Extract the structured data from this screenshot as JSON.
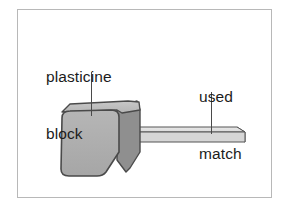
{
  "figure": {
    "frame": {
      "border_color": "#b8b8b8",
      "background": "#ffffff"
    },
    "labels": [
      {
        "name": "plasticine-block-label",
        "text": "plasticine\nblock",
        "line1": "plasticine",
        "line2": "block"
      },
      {
        "name": "used-match-label",
        "text": "used\nmatch",
        "line1": "used",
        "line2": "match"
      }
    ],
    "objects": [
      {
        "name": "plasticine-block",
        "shape": "rounded-cube",
        "front_face_color": "#b0b0b0",
        "top_face_color": "#c2c2c2",
        "side_face_color": "#8e8e8e",
        "outline_color": "#4a4a4a"
      },
      {
        "name": "used-match",
        "shape": "rectangular-stick",
        "top_face_color": "#e2e2e2",
        "front_face_color": "#d2d2d2",
        "end_face_color": "#a8a8a8",
        "outline_color": "#555555"
      }
    ],
    "leader_lines": [
      {
        "name": "leader-line-to-block",
        "color": "#4a4a4a"
      },
      {
        "name": "leader-line-to-match",
        "color": "#4a4a4a"
      }
    ]
  }
}
